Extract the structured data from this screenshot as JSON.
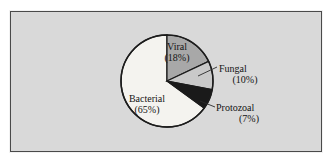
{
  "figure": {
    "background_color": "#ffffff",
    "panel_color": "#d9d9d9",
    "border_color": "#4a4a4a"
  },
  "chart_data": {
    "type": "pie",
    "title": "",
    "subtitle": "",
    "xlabel": "",
    "ylabel": "",
    "grid": false,
    "legend": "none",
    "label_style": "callout",
    "start_angle_deg": 0,
    "direction": "clockwise",
    "categories": [
      "Viral",
      "Fungal",
      "Protozoal",
      "Bacterial"
    ],
    "values": [
      18,
      10,
      7,
      65
    ],
    "units": "percent",
    "total": 100,
    "slices": [
      {
        "name": "Viral",
        "label": "Viral",
        "value": 18,
        "value_label": "(18%)",
        "color": "#a8a8a8",
        "label_placement": "inside",
        "start_deg": 0,
        "end_deg": 64.8
      },
      {
        "name": "Fungal",
        "label": "Fungal",
        "value": 10,
        "value_label": "(10%)",
        "color": "#c9c9c9",
        "label_placement": "callout",
        "start_deg": 64.8,
        "end_deg": 100.8
      },
      {
        "name": "Protozoal",
        "label": "Protozoal",
        "value": 7,
        "value_label": "(7%)",
        "color": "#1a1a1a",
        "label_placement": "callout",
        "start_deg": 100.8,
        "end_deg": 126.0
      },
      {
        "name": "Bacterial",
        "label": "Bacterial",
        "value": 65,
        "value_label": "(65%)",
        "color": "#f4f3ef",
        "label_placement": "inside",
        "start_deg": 126.0,
        "end_deg": 360.0
      }
    ],
    "geometry": {
      "center_x": 167,
      "center_y": 81,
      "radius": 46
    }
  }
}
